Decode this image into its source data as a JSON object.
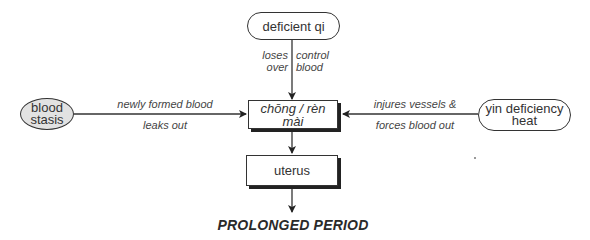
{
  "diagram": {
    "nodes": {
      "deficient_qi": {
        "label": "deficient qi",
        "shape": "pill"
      },
      "blood_stasis": {
        "label_line1": "blood",
        "label_line2": "stasis",
        "shape": "ellipse",
        "fill": "#e2e2e2"
      },
      "chong_ren_mai": {
        "label": "chōng / rèn mài",
        "shape": "shadowed-rect",
        "italic": true
      },
      "yin_deficiency_heat": {
        "label_line1": "yin deficiency",
        "label_line2": "heat",
        "shape": "pill"
      },
      "uterus": {
        "label": "uterus",
        "shape": "shadowed-rect"
      }
    },
    "edges": [
      {
        "from": "deficient_qi",
        "to": "chong_ren_mai",
        "label_left": [
          "loses",
          "over"
        ],
        "label_right": [
          "control",
          "blood"
        ]
      },
      {
        "from": "blood_stasis",
        "to": "chong_ren_mai",
        "label_above": "newly formed blood",
        "label_below": "leaks out"
      },
      {
        "from": "yin_deficiency_heat",
        "to": "chong_ren_mai",
        "label_above": "injures vessels &",
        "label_below": "forces blood out"
      },
      {
        "from": "chong_ren_mai",
        "to": "uterus"
      },
      {
        "from": "uterus",
        "to": "outcome"
      }
    ],
    "outcome": "PROLONGED PERIOD"
  }
}
